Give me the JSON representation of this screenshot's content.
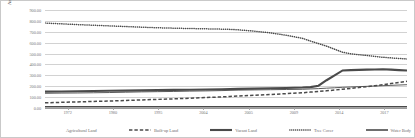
{
  "chart_data": {
    "type": "line",
    "title": "",
    "xlabel": "",
    "ylabel": "Area in sq. km",
    "ylim": [
      0,
      900
    ],
    "grid": true,
    "legend_position": "bottom",
    "y_ticks": [
      "0.00",
      "100.00",
      "200.00",
      "300.00",
      "400.00",
      "500.00",
      "600.00",
      "700.00",
      "800.00",
      "900.00"
    ],
    "x_tick_labels": [
      "1972",
      "1980",
      "1995",
      "2004",
      "2005",
      "2009",
      "2014",
      "2017"
    ],
    "x": [
      1972,
      1974,
      1976,
      1978,
      1980,
      1982,
      1984,
      1986,
      1988,
      1990,
      1992,
      1994,
      1995,
      1996,
      1998,
      2000,
      2002,
      2004,
      2005,
      2006,
      2007,
      2008,
      2009,
      2010,
      2011,
      2012,
      2013,
      2014,
      2015,
      2016,
      2017
    ],
    "series": [
      {
        "name": "Agricultural Land",
        "style": "solid-thin",
        "values": [
          135,
          137,
          138,
          140,
          142,
          145,
          148,
          150,
          152,
          155,
          157,
          160,
          162,
          164,
          166,
          168,
          170,
          172,
          175,
          178,
          182,
          186,
          190,
          193,
          196,
          199,
          202,
          205,
          208,
          211,
          214
        ]
      },
      {
        "name": "Built-up Land",
        "style": "dashed",
        "values": [
          48,
          52,
          56,
          60,
          64,
          69,
          74,
          79,
          84,
          90,
          96,
          102,
          106,
          110,
          117,
          124,
          132,
          140,
          146,
          152,
          158,
          165,
          172,
          180,
          188,
          196,
          205,
          214,
          224,
          234,
          245
        ]
      },
      {
        "name": "Vacant Land",
        "style": "solid-thick",
        "values": [
          150,
          152,
          154,
          156,
          158,
          160,
          162,
          164,
          166,
          168,
          170,
          172,
          174,
          176,
          178,
          181,
          184,
          188,
          192,
          205,
          255,
          300,
          345,
          348,
          350,
          352,
          354,
          356,
          352,
          348,
          345
        ]
      },
      {
        "name": "Tree Cover",
        "style": "dotted",
        "values": [
          780,
          773,
          766,
          760,
          754,
          748,
          742,
          737,
          733,
          730,
          727,
          724,
          722,
          718,
          706,
          690,
          668,
          640,
          615,
          592,
          568,
          540,
          512,
          498,
          490,
          482,
          474,
          466,
          460,
          455,
          450
        ]
      },
      {
        "name": "Water Body",
        "style": "solid-thick-flat",
        "values": [
          12,
          12,
          12,
          12,
          12,
          12,
          12,
          12,
          12,
          12,
          12,
          12,
          12,
          12,
          12,
          12,
          12,
          12,
          12,
          12,
          12,
          12,
          12,
          12,
          12,
          12,
          12,
          12,
          12,
          12,
          12
        ]
      }
    ]
  },
  "colors": {
    "series": "#4a4a4a",
    "gridline": "#d2d2d2",
    "axis": "#9a9a9a",
    "text": "#6f6f6f",
    "background": "#ffffff",
    "border": "#c9c9c9"
  }
}
